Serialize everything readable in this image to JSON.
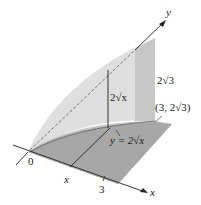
{
  "figure": {
    "type": "3d-solid-cross-section",
    "axes": {
      "x_label": "x",
      "y_label": "y",
      "origin_label": "0"
    },
    "labels": {
      "x_marker": "x",
      "three_marker": "3",
      "height_at_x": "2√x",
      "height_at_3": "2√3",
      "corner_point": "(3, 2√3)",
      "curve": "y = 2√x"
    },
    "colors": {
      "base": "#9a9a9a",
      "wall": "#c8c8c8",
      "curved_surface": "#d9d9d9",
      "line": "#222222"
    }
  }
}
